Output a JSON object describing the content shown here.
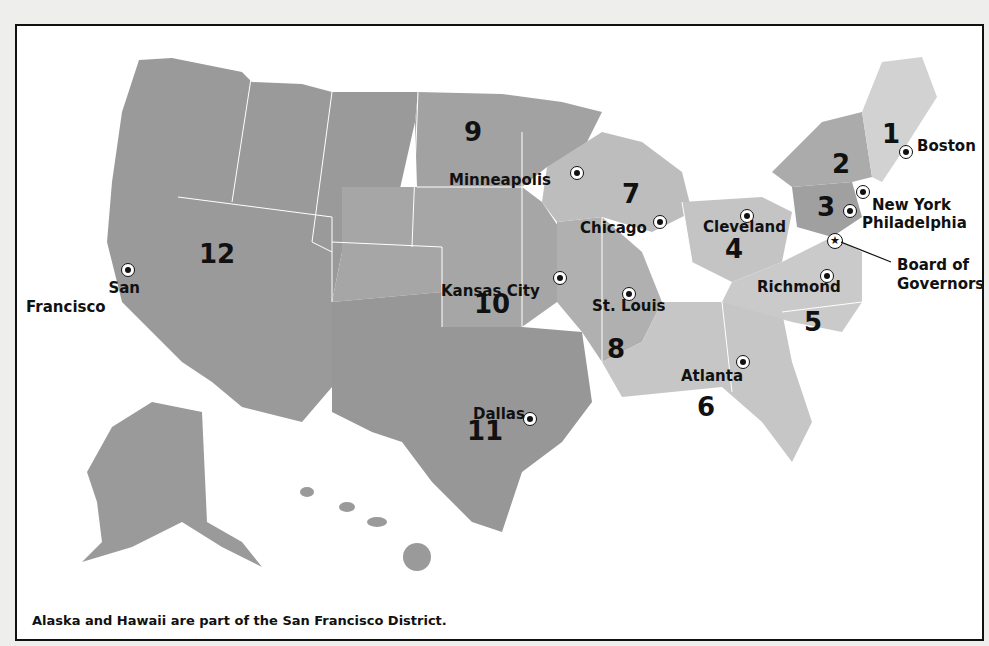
{
  "map": {
    "caption": "Alaska and Hawaii are part of the San Francisco District.",
    "districts": [
      {
        "number": "1",
        "city": "Boston"
      },
      {
        "number": "2",
        "city": "New York"
      },
      {
        "number": "3",
        "city": "Philadelphia"
      },
      {
        "number": "4",
        "city": "Cleveland"
      },
      {
        "number": "5",
        "city": "Richmond"
      },
      {
        "number": "6",
        "city": "Atlanta"
      },
      {
        "number": "7",
        "city": "Chicago"
      },
      {
        "number": "8",
        "city": "St. Louis"
      },
      {
        "number": "9",
        "city": "Minneapolis"
      },
      {
        "number": "10",
        "city": "Kansas City"
      },
      {
        "number": "11",
        "city": "Dallas"
      },
      {
        "number": "12",
        "city": "San Francisco"
      }
    ],
    "headquarters": {
      "label_line1": "Board of",
      "label_line2": "Governors",
      "icon": "star-icon"
    },
    "sf_label_line1": "San",
    "sf_label_line2": "Francisco",
    "colors": {
      "frame_border": "#111111",
      "land_dark": "#9a9a9a",
      "land_mid": "#b4b4b4",
      "land_light": "#cfcfcf",
      "state_border": "#ffffff"
    }
  }
}
